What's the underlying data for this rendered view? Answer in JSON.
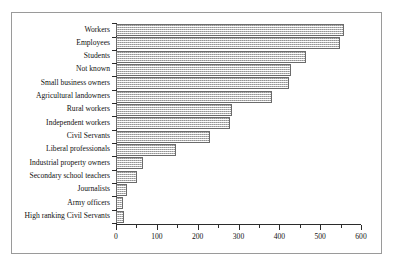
{
  "chart_data": {
    "type": "bar",
    "orientation": "horizontal",
    "title": "",
    "subtitle": "",
    "xlabel": "",
    "ylabel": "",
    "xlim": [
      0,
      600
    ],
    "ylim": null,
    "grid": false,
    "legend": null,
    "legend_position": "none",
    "x_ticks": [
      0,
      100,
      200,
      300,
      400,
      500,
      600
    ],
    "x_tick_labels": [
      "0",
      "100",
      "200",
      "300",
      "400",
      "500",
      "600"
    ],
    "x_minor_tick_step": 50,
    "categories": [
      "Workers",
      "Employees",
      "Students",
      "Not known",
      "Small business owners",
      "Agricultural landowners",
      "Rural workers",
      "Independent workers",
      "Civil Servants",
      "Liberal professionals",
      "Industrial property owners",
      "Secondary school teachers",
      "Journalists",
      "Army officers",
      "High ranking Civil Servants"
    ],
    "values": [
      558,
      548,
      465,
      428,
      423,
      383,
      283,
      278,
      231,
      148,
      66,
      51,
      27,
      17,
      19
    ],
    "bar_fill_color": "#d8d8d8",
    "bar_edge_color": "#6b6b6b",
    "bar_pattern": "fine-checker",
    "frame_color": "#9a9a9a",
    "axis_color": "#2b2b2b"
  },
  "axis": {
    "x_tick_labels": [
      "0",
      "100",
      "200",
      "300",
      "400",
      "500",
      "600"
    ]
  }
}
